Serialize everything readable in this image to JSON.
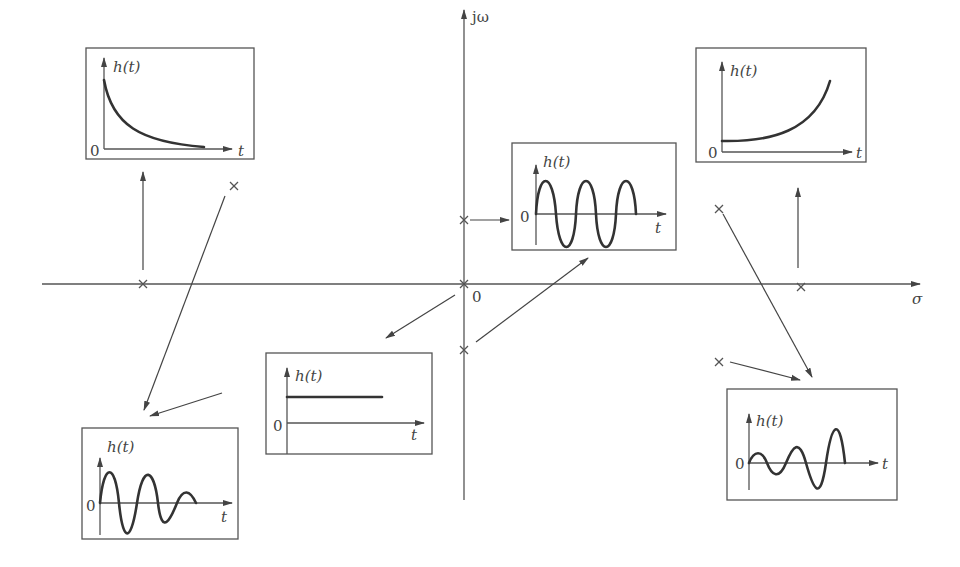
{
  "axes": {
    "imag_label": "jω",
    "real_label": "σ",
    "origin_label": "0"
  },
  "panels": [
    {
      "id": "decaying-exponential",
      "y_label": "h(t)",
      "x_label": "t",
      "zero_label": "0",
      "pole": "left real axis"
    },
    {
      "id": "sustained-oscillation",
      "y_label": "h(t)",
      "x_label": "t",
      "zero_label": "0",
      "pole": "imaginary axis pair"
    },
    {
      "id": "growing-exponential",
      "y_label": "h(t)",
      "x_label": "t",
      "zero_label": "0",
      "pole": "right real axis"
    },
    {
      "id": "constant-step",
      "y_label": "h(t)",
      "x_label": "t",
      "zero_label": "0",
      "pole": "origin"
    },
    {
      "id": "damped-oscillation",
      "y_label": "h(t)",
      "x_label": "t",
      "zero_label": "0",
      "pole": "left half-plane pair"
    },
    {
      "id": "growing-oscillation",
      "y_label": "h(t)",
      "x_label": "t",
      "zero_label": "0",
      "pole": "right half-plane pair"
    }
  ],
  "colors": {
    "line": "#444444",
    "curve": "#333333",
    "background": "#ffffff"
  }
}
